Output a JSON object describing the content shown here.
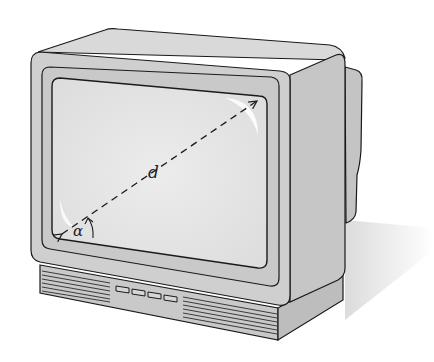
{
  "figure": {
    "labels": {
      "diagonal": "d",
      "angle": "α"
    },
    "colors": {
      "cabinet": "#cfcfcf",
      "cabinet_top": "#d9d9d9",
      "bezel": "#c8c8c8",
      "screen": "#e4e4e4",
      "outline": "#1a1a1a",
      "shadow": "#e6e6e6"
    },
    "control_buttons": 4
  }
}
